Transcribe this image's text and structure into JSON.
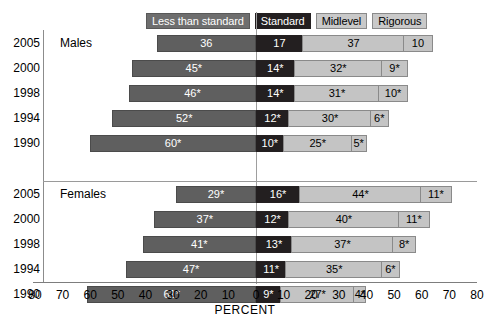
{
  "legend": {
    "items": [
      {
        "label": "Less than standard",
        "color": "#6e6e6e",
        "text_color": "#ffffff"
      },
      {
        "label": "Standard",
        "color": "#231f20",
        "text_color": "#ffffff"
      },
      {
        "label": "Midlevel",
        "color": "#c9c9c9",
        "text_color": "#000000"
      },
      {
        "label": "Rigorous",
        "color": "#c9c9c9",
        "text_color": "#000000"
      }
    ]
  },
  "groups": [
    {
      "name": "Males"
    },
    {
      "name": "Females"
    }
  ],
  "axis": {
    "xlabel": "PERCENT",
    "ticks": [
      "80",
      "70",
      "60",
      "50",
      "40",
      "30",
      "20",
      "10",
      "0",
      "10",
      "20",
      "30",
      "40",
      "50",
      "60",
      "70",
      "80"
    ],
    "tick_values": [
      -80,
      -70,
      -60,
      -50,
      -40,
      -30,
      -20,
      -10,
      0,
      10,
      20,
      30,
      40,
      50,
      60,
      70,
      80
    ],
    "xlim": [
      -80,
      80
    ],
    "zero_at": 0
  },
  "rows": [
    {
      "group": "Males",
      "year": "2005",
      "less": "36",
      "standard": "17",
      "midlevel": "37",
      "rigorous": "10"
    },
    {
      "group": "Males",
      "year": "2000",
      "less": "45*",
      "standard": "14*",
      "midlevel": "32*",
      "rigorous": "9*"
    },
    {
      "group": "Males",
      "year": "1998",
      "less": "46*",
      "standard": "14*",
      "midlevel": "31*",
      "rigorous": "10*"
    },
    {
      "group": "Males",
      "year": "1994",
      "less": "52*",
      "standard": "12*",
      "midlevel": "30*",
      "rigorous": "6*"
    },
    {
      "group": "Males",
      "year": "1990",
      "less": "60*",
      "standard": "10*",
      "midlevel": "25*",
      "rigorous": "5*"
    },
    {
      "group": "Females",
      "year": "2005",
      "less": "29*",
      "standard": "16*",
      "midlevel": "44*",
      "rigorous": "11*"
    },
    {
      "group": "Females",
      "year": "2000",
      "less": "37*",
      "standard": "12*",
      "midlevel": "40*",
      "rigorous": "11*"
    },
    {
      "group": "Females",
      "year": "1998",
      "less": "41*",
      "standard": "13*",
      "midlevel": "37*",
      "rigorous": "8*"
    },
    {
      "group": "Females",
      "year": "1994",
      "less": "47*",
      "standard": "11*",
      "midlevel": "35*",
      "rigorous": "6*"
    },
    {
      "group": "Females",
      "year": "1990",
      "less": "61*",
      "standard": "9*",
      "midlevel": "27*",
      "rigorous": "4*"
    }
  ],
  "chart_data": {
    "type": "bar",
    "subtype": "diverging-stacked-horizontal",
    "title": "",
    "xlabel": "PERCENT",
    "ylabel": "",
    "xlim": [
      -80,
      80
    ],
    "grid": false,
    "legend_position": "top",
    "categories": [
      "Males 2005",
      "Males 2000",
      "Males 1998",
      "Males 1994",
      "Males 1990",
      "Females 2005",
      "Females 2000",
      "Females 1998",
      "Females 1994",
      "Females 1990"
    ],
    "series": [
      {
        "name": "Less than standard",
        "color": "#5f5f5f",
        "values": [
          36,
          45,
          46,
          52,
          60,
          29,
          37,
          41,
          47,
          61
        ],
        "labels": [
          "36",
          "45*",
          "46*",
          "52*",
          "60*",
          "29*",
          "37*",
          "41*",
          "47*",
          "61*"
        ],
        "side": "left"
      },
      {
        "name": "Standard",
        "color": "#231f20",
        "values": [
          17,
          14,
          14,
          12,
          10,
          16,
          12,
          13,
          11,
          9
        ],
        "labels": [
          "17",
          "14*",
          "14*",
          "12*",
          "10*",
          "16*",
          "12*",
          "13*",
          "11*",
          "9*"
        ],
        "side": "right"
      },
      {
        "name": "Midlevel",
        "color": "#c4c4c4",
        "values": [
          37,
          32,
          31,
          30,
          25,
          44,
          40,
          37,
          35,
          27
        ],
        "labels": [
          "37",
          "32*",
          "31*",
          "30*",
          "25*",
          "44*",
          "40*",
          "37*",
          "35*",
          "27*"
        ],
        "side": "right"
      },
      {
        "name": "Rigorous",
        "color": "#c4c4c4",
        "values": [
          10,
          9,
          10,
          6,
          5,
          11,
          11,
          8,
          6,
          4
        ],
        "labels": [
          "10",
          "9*",
          "10*",
          "6*",
          "5*",
          "11*",
          "11*",
          "8*",
          "6*",
          "4*"
        ],
        "side": "right"
      }
    ]
  }
}
